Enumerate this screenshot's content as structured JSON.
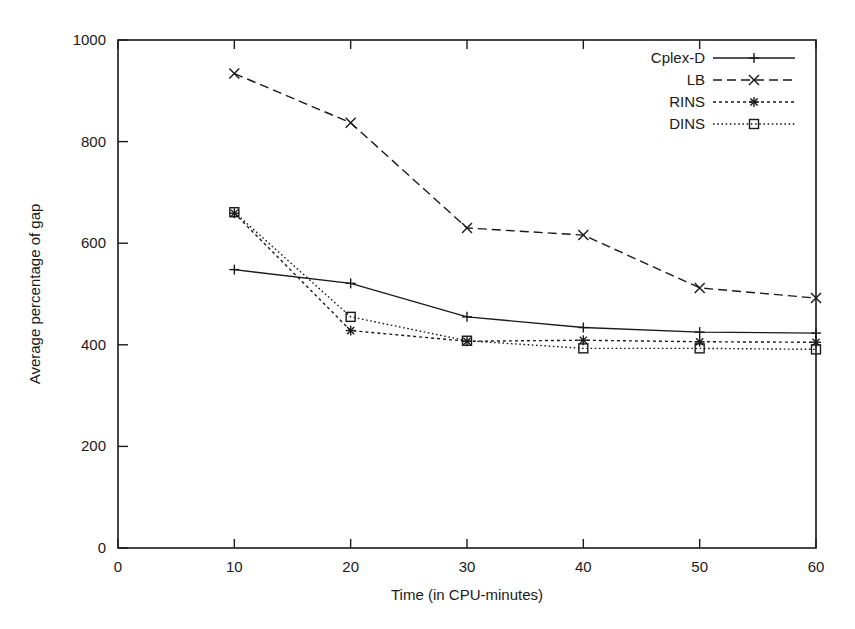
{
  "chart_data": {
    "type": "line",
    "title": "",
    "xlabel": "Time (in CPU-minutes)",
    "ylabel": "Average percentage of gap",
    "x": [
      10,
      20,
      30,
      40,
      50,
      60
    ],
    "xlim": [
      0,
      60
    ],
    "ylim": [
      0,
      1000
    ],
    "xticks": [
      "0",
      "10",
      "20",
      "30",
      "40",
      "50",
      "60"
    ],
    "xtick_values": [
      0,
      10,
      20,
      30,
      40,
      50,
      60
    ],
    "yticks": [
      "0",
      "200",
      "400",
      "600",
      "800",
      "1000"
    ],
    "ytick_values": [
      0,
      200,
      400,
      600,
      800,
      1000
    ],
    "grid": false,
    "legend_position": "top-right",
    "series": [
      {
        "name": "Cplex-D",
        "values": [
          548,
          521,
          455,
          434,
          425,
          423
        ],
        "line_style": "solid",
        "marker": "plus",
        "color": "#1a1a1a"
      },
      {
        "name": "LB",
        "values": [
          934,
          837,
          630,
          616,
          512,
          492
        ],
        "line_style": "dashed",
        "marker": "cross",
        "color": "#1a1a1a"
      },
      {
        "name": "RINS",
        "values": [
          659,
          428,
          407,
          409,
          406,
          405
        ],
        "line_style": "dotted",
        "marker": "asterisk",
        "color": "#1a1a1a"
      },
      {
        "name": "DINS",
        "values": [
          661,
          455,
          408,
          393,
          393,
          391
        ],
        "line_style": "fine-dotted",
        "marker": "square",
        "color": "#1a1a1a"
      }
    ]
  }
}
